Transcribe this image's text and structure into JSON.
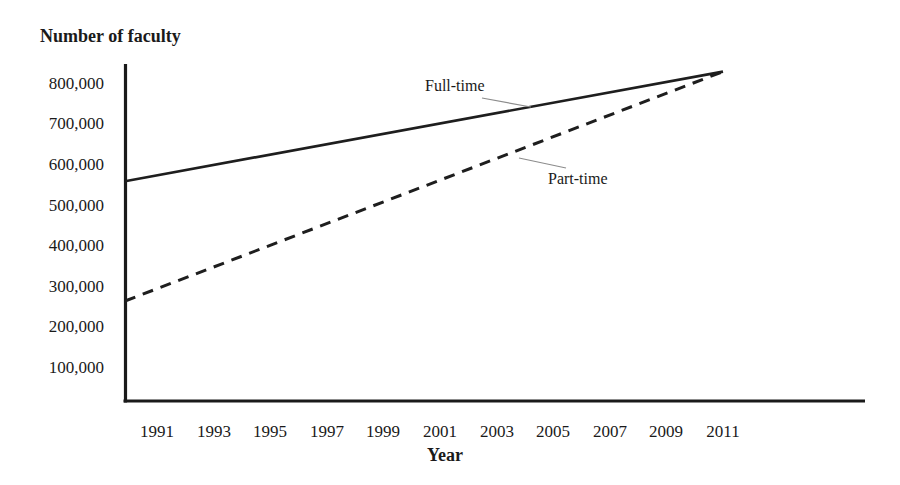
{
  "chart_data": {
    "type": "line",
    "title": "",
    "ylabel": "Number of faculty",
    "xlabel": "Year",
    "x_ticks": [
      1991,
      1993,
      1995,
      1997,
      1999,
      2001,
      2003,
      2005,
      2007,
      2009,
      2011
    ],
    "y_ticks": [
      {
        "label": "800,000",
        "value": 800000
      },
      {
        "label": "700,000",
        "value": 700000
      },
      {
        "label": "600,000",
        "value": 600000
      },
      {
        "label": "500,000",
        "value": 500000
      },
      {
        "label": "400,000",
        "value": 400000
      },
      {
        "label": "300,000",
        "value": 300000
      },
      {
        "label": "200,000",
        "value": 200000
      },
      {
        "label": "100,000",
        "value": 100000
      }
    ],
    "xlim": [
      1991,
      2011
    ],
    "ylim": [
      0,
      850000
    ],
    "grid": false,
    "legend_position": "inline annotations with leader lines",
    "series": [
      {
        "name": "Full-time",
        "line_style": "solid",
        "x": [
          1991,
          2011
        ],
        "values": [
          560000,
          830000
        ]
      },
      {
        "name": "Part-time",
        "line_style": "dashed",
        "x": [
          1991,
          2011
        ],
        "values": [
          265000,
          830000
        ]
      }
    ]
  },
  "colors": {
    "background": "#ffffff",
    "axis": "#1a1a1a",
    "line": "#1e1e1e",
    "text": "#1a1a1a",
    "leader_line": "#8c8c8c"
  }
}
